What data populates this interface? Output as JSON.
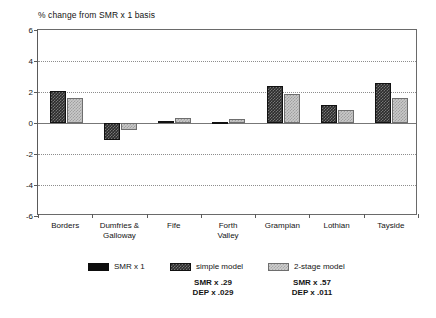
{
  "chart_data": {
    "type": "bar",
    "title": "% change from SMR x 1 basis",
    "xlabel": "",
    "ylabel": "",
    "ylim": [
      -6,
      6
    ],
    "yticks": [
      6,
      4,
      2,
      0,
      -2,
      -4,
      -6
    ],
    "grid": true,
    "legend_position": "bottom",
    "categories": [
      "Borders",
      "Dumfries &\nGalloway",
      "Fife",
      "Forth\nValley",
      "Grampian",
      "Lothian",
      "Tayside"
    ],
    "series": [
      {
        "name": "simple model",
        "color": "#2b2b2b",
        "values": [
          2.05,
          -1.1,
          0.1,
          0.05,
          2.4,
          1.15,
          2.6
        ]
      },
      {
        "name": "2-stage model",
        "color": "#c9c9c9",
        "values": [
          1.6,
          -0.45,
          0.35,
          0.25,
          1.85,
          0.85,
          1.6
        ]
      }
    ]
  },
  "legend": {
    "entries": [
      {
        "label": "SMR x 1",
        "swatch": "solidblack",
        "note": ""
      },
      {
        "label": "simple model",
        "swatch": "dark",
        "note": "SMR x .29\nDEP x .029"
      },
      {
        "label": "2-stage model",
        "swatch": "light",
        "note": "SMR x .57\nDEP x .011"
      }
    ]
  }
}
